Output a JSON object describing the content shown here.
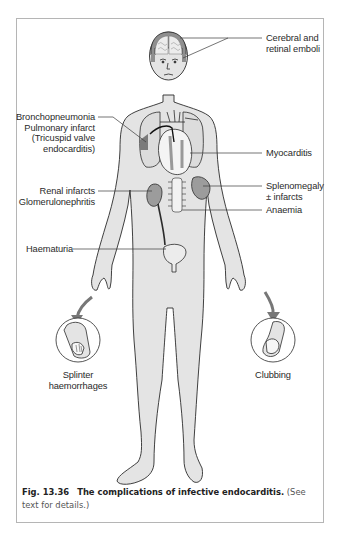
{
  "figure": {
    "number": "Fig. 13.36",
    "title": "The complications of infective endocarditis.",
    "note": "(See text for details.)"
  },
  "labels": {
    "cerebral": [
      "Cerebral and",
      "retinal emboli"
    ],
    "bronchopneumonia": [
      "Bronchopneumonia",
      "Pulmonary infarct",
      "(Tricuspid valve",
      "endocarditis)"
    ],
    "myocarditis": "Myocarditis",
    "renal": [
      "Renal infarcts",
      "Glomerulonephritis"
    ],
    "splenomegaly": [
      "Splenomegaly",
      "± infarcts"
    ],
    "anaemia": "Anaemia",
    "haematuria": "Haematuria",
    "splinter": [
      "Splinter",
      "haemorrhages"
    ],
    "clubbing": "Clubbing"
  },
  "colors": {
    "skin": "#e4e4e4",
    "organ": "#9c9c9c",
    "outline": "#2b2b2b",
    "leader_line": "#3a3a3a",
    "frame": "#b5b5b5"
  }
}
